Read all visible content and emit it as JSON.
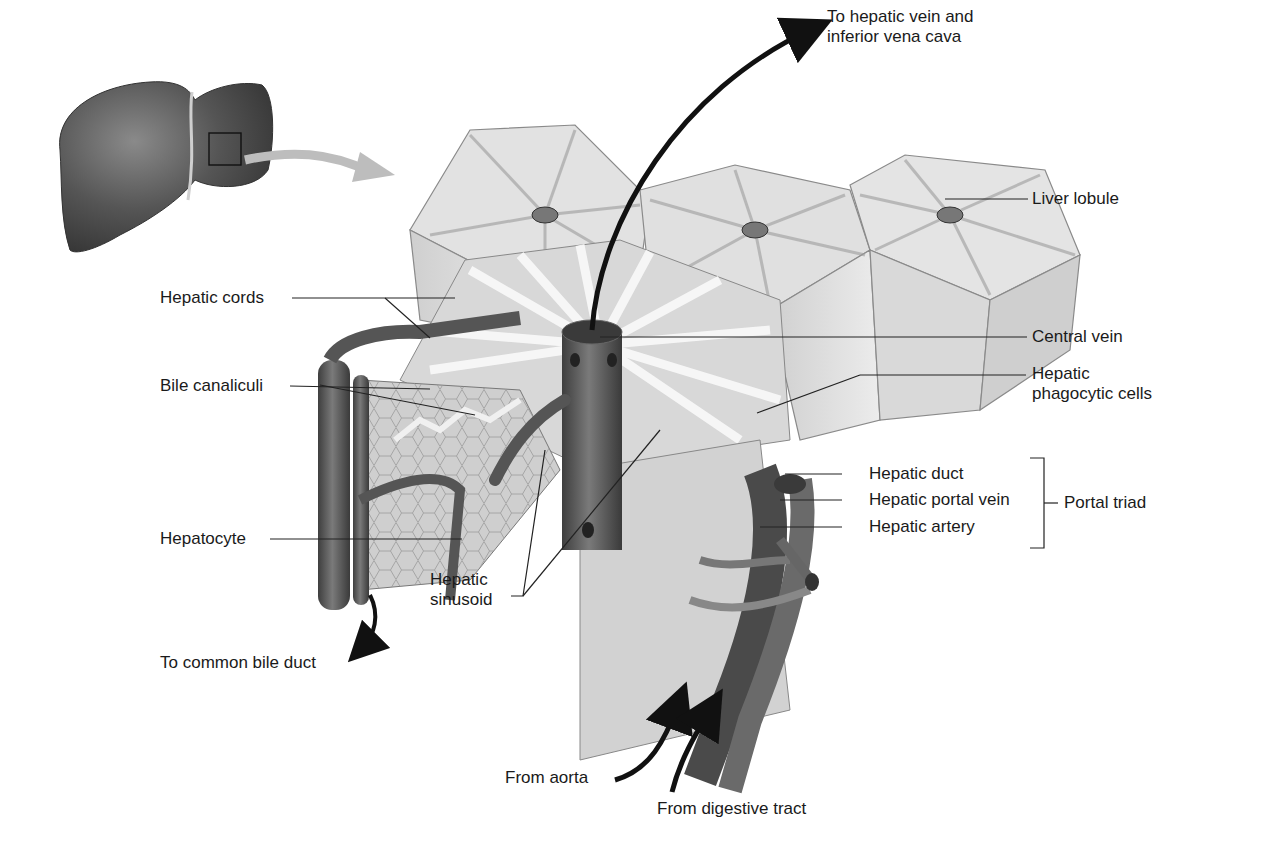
{
  "diagram": {
    "colors": {
      "background": "#ffffff",
      "tissue_light": "#d6d6d6",
      "tissue_mid": "#a8a8a8",
      "vessel_dark": "#5a5a5a",
      "liver_dark": "#4a4a4a",
      "arrow": "#111111",
      "leader": "#222222"
    },
    "labels": {
      "to_hepatic_vein_1": "To hepatic vein and",
      "to_hepatic_vein_2": "inferior vena cava",
      "liver_lobule": "Liver lobule",
      "hepatic_cords": "Hepatic cords",
      "central_vein": "Central vein",
      "bile_canaliculi": "Bile canaliculi",
      "hepatic_phagocytic_1": "Hepatic",
      "hepatic_phagocytic_2": "phagocytic cells",
      "hepatic_duct": "Hepatic duct",
      "hepatic_portal_vein": "Hepatic portal vein",
      "hepatic_artery": "Hepatic artery",
      "portal_triad": "Portal triad",
      "hepatocyte": "Hepatocyte",
      "hepatic_sinusoid_1": "Hepatic",
      "hepatic_sinusoid_2": "sinusoid",
      "to_common_bile_duct": "To common bile duct",
      "from_aorta": "From aorta",
      "from_digestive_tract": "From digestive tract"
    }
  }
}
